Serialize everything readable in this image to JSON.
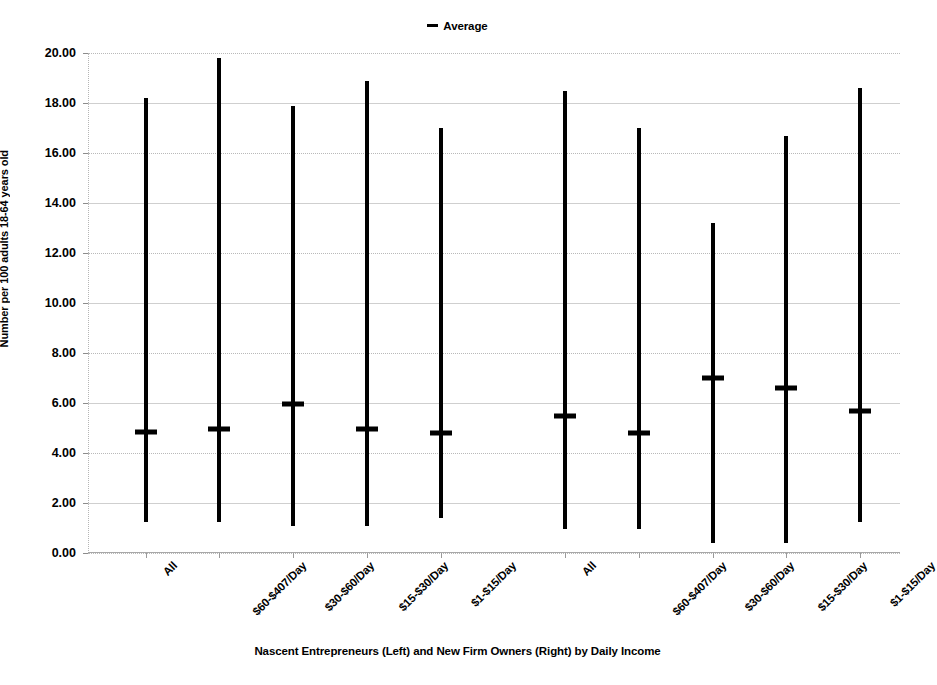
{
  "legend": {
    "entries": [
      {
        "label": "Average",
        "marker": "dash-marker",
        "color": "#000000"
      }
    ]
  },
  "chart_data": {
    "type": "bar",
    "title": "",
    "subtitle": "",
    "xlabel": "Nascent Entrepreneurs (Left) and New Firm Owners (Right) by Daily Income",
    "ylabel": "Number per 100 adults 18-64 years old",
    "ylim": [
      0.0,
      20.0
    ],
    "ytick_step": 2.0,
    "ytick_labels": [
      "0.00",
      "2.00",
      "4.00",
      "6.00",
      "8.00",
      "10.00",
      "12.00",
      "14.00",
      "16.00",
      "18.00",
      "20.00"
    ],
    "ytick_values": [
      0,
      2,
      4,
      6,
      8,
      10,
      12,
      14,
      16,
      18,
      20
    ],
    "grid": true,
    "legend_position": "top-center",
    "categories": [
      "All",
      "$60-$407/Day",
      "$30-$60/Day",
      "$15-$30/Day",
      "$1-$15/Day",
      "All",
      "$60-$407/Day",
      "$30-$60/Day",
      "$15-$30/Day",
      "$1-$15/Day"
    ],
    "groups": [
      {
        "name": "Nascent Entrepreneurs (Left)",
        "category_indices": [
          0,
          1,
          2,
          3,
          4
        ]
      },
      {
        "name": "New Firm Owners (Right)",
        "category_indices": [
          5,
          6,
          7,
          8,
          9
        ]
      }
    ],
    "series": [
      {
        "name": "Range (min-max)",
        "type": "range-bar",
        "low": [
          1.25,
          1.25,
          1.1,
          1.1,
          1.4,
          0.95,
          0.95,
          0.4,
          0.4,
          1.25
        ],
        "high": [
          18.2,
          19.8,
          17.9,
          18.9,
          17.0,
          18.5,
          17.0,
          13.2,
          16.7,
          18.6
        ]
      },
      {
        "name": "Average",
        "type": "marker",
        "values": [
          4.85,
          4.95,
          5.95,
          4.95,
          4.8,
          5.5,
          4.8,
          7.0,
          6.6,
          5.7
        ]
      }
    ]
  }
}
